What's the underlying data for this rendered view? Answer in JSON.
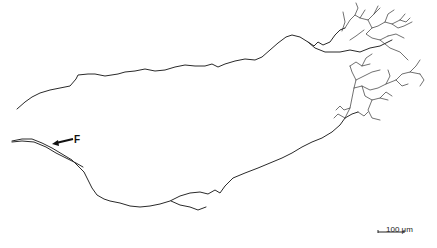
{
  "figure": {
    "annotation_label": "F",
    "scale_bar": {
      "label": "100 μm"
    },
    "colors": {
      "trace": "#2a2a2a",
      "background": "#ffffff"
    }
  }
}
